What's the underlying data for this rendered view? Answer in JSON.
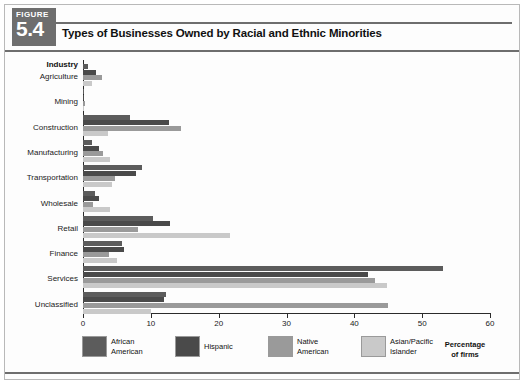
{
  "figure": {
    "badge_word": "FIGURE",
    "badge_number": "5.4",
    "title": "Types of Businesses Owned by Racial and Ethnic Minorities"
  },
  "chart_data": {
    "type": "bar",
    "orientation": "horizontal",
    "title": "Types of Businesses Owned by Racial and Ethnic Minorities",
    "xlabel": "Percentage of firms",
    "ylabel": "Industry",
    "xlim": [
      0,
      60
    ],
    "xticks": [
      0,
      10,
      20,
      30,
      40,
      50,
      60
    ],
    "grid": false,
    "legend_position": "bottom",
    "categories": [
      "Agriculture",
      "Mining",
      "Construction",
      "Manufacturing",
      "Transportation",
      "Wholesale",
      "Retail",
      "Finance",
      "Services",
      "Unclassified"
    ],
    "series": [
      {
        "name": "African American",
        "color": "#5c5c5c",
        "values": [
          0.7,
          0.2,
          7.0,
          1.3,
          8.7,
          1.8,
          10.3,
          5.8,
          53.0,
          12.2
        ]
      },
      {
        "name": "Hispanic",
        "color": "#4a4a4a",
        "values": [
          1.9,
          0.2,
          12.7,
          2.4,
          7.8,
          2.4,
          12.8,
          6.0,
          42.0,
          12.0
        ]
      },
      {
        "name": "Native American",
        "color": "#9a9a9a",
        "values": [
          2.8,
          0.3,
          14.5,
          3.0,
          4.7,
          1.5,
          8.1,
          3.8,
          43.0,
          45.0
        ]
      },
      {
        "name": "Asian/Pacific Islander",
        "color": "#c9c9c9",
        "values": [
          1.3,
          0.1,
          3.7,
          4.0,
          4.3,
          4.0,
          21.7,
          5.0,
          44.8,
          10.0
        ]
      }
    ]
  },
  "legend": [
    {
      "label_line1": "African",
      "label_line2": "American",
      "color": "#5c5c5c"
    },
    {
      "label_line1": "Hispanic",
      "label_line2": "",
      "color": "#4a4a4a"
    },
    {
      "label_line1": "Native",
      "label_line2": "American",
      "color": "#9a9a9a"
    },
    {
      "label_line1": "Asian/Pacific",
      "label_line2": "Islander",
      "color": "#c9c9c9"
    }
  ],
  "axis_caption": {
    "line1": "Percentage",
    "line2": "of firms"
  }
}
